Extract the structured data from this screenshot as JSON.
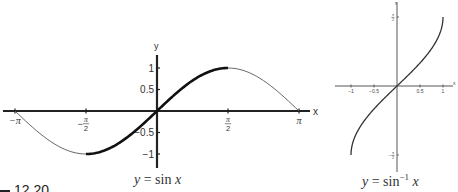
{
  "figure": {
    "label_fragment": "12.20",
    "left_caption": {
      "var": "y",
      "eq": " = sin ",
      "arg": "x"
    },
    "right_caption": {
      "var": "y",
      "eq": " = sin",
      "sup": "−1",
      "arg": " x"
    }
  },
  "chart_data": [
    {
      "type": "line",
      "title": "y = sin x",
      "xlabel": "x",
      "ylabel": "y",
      "xlim": [
        -3.1416,
        3.1416
      ],
      "ylim": [
        -1.2,
        1.2
      ],
      "x_ticks": [
        {
          "value": -3.1416,
          "label": "−π"
        },
        {
          "value": -1.5708,
          "label": "−π/2"
        },
        {
          "value": 1.5708,
          "label": "π/2"
        },
        {
          "value": 3.1416,
          "label": "π"
        }
      ],
      "y_ticks": [
        {
          "value": 1,
          "label": "1"
        },
        {
          "value": 0.5,
          "label": "0.5"
        },
        {
          "value": -0.5,
          "label": "−0.5"
        },
        {
          "value": -1,
          "label": "−1"
        }
      ],
      "grid": false,
      "series": [
        {
          "name": "sin x (full period)",
          "style": "thin",
          "x_range": [
            -3.1416,
            3.1416
          ]
        },
        {
          "name": "sin x (restricted domain)",
          "style": "bold",
          "x_range": [
            -1.5708,
            1.5708
          ]
        }
      ],
      "x": [
        -3.1416,
        -2.3562,
        -1.5708,
        -0.7854,
        0,
        0.7854,
        1.5708,
        2.3562,
        3.1416
      ],
      "values": [
        0,
        -0.7071,
        -1,
        -0.7071,
        0,
        0.7071,
        1,
        0.7071,
        0
      ]
    },
    {
      "type": "line",
      "title": "y = sin⁻¹ x",
      "xlabel": "x",
      "ylabel": "y",
      "xlim": [
        -1.3,
        1.3
      ],
      "ylim": [
        -1.5708,
        1.5708
      ],
      "x_ticks": [
        {
          "value": -1,
          "label": "−1"
        },
        {
          "value": -0.5,
          "label": "−0.5"
        },
        {
          "value": 0.5,
          "label": "0.5"
        },
        {
          "value": 1,
          "label": "1"
        }
      ],
      "y_ticks": [
        {
          "value": 1.5708,
          "label": "π/2"
        },
        {
          "value": -1.5708,
          "label": "−π/2"
        }
      ],
      "grid": false,
      "series": [
        {
          "name": "arcsin x",
          "style": "medium",
          "x_range": [
            -1,
            1
          ]
        }
      ],
      "x": [
        -1,
        -0.5,
        0,
        0.5,
        1
      ],
      "values": [
        -1.5708,
        -0.5236,
        0,
        0.5236,
        1.5708
      ]
    }
  ]
}
